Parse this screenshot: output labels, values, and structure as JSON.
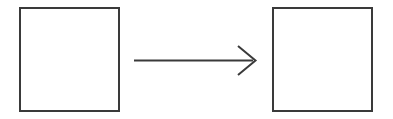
{
  "canvas": {
    "width": 393,
    "height": 119,
    "background_color": "#ffffff"
  },
  "diagram": {
    "type": "transformation-diagram",
    "stroke_color": "#3a3a3a",
    "fill_color": "#ffffff",
    "stroke_width": 2,
    "shapes": [
      {
        "name": "source-square",
        "kind": "rect",
        "label": "",
        "x": 20,
        "y": 8,
        "width": 99,
        "height": 103,
        "stroke": "#3a3a3a",
        "fill": "#ffffff",
        "stroke_width": 2
      },
      {
        "name": "target-square",
        "kind": "rect",
        "label": "",
        "x": 273,
        "y": 8,
        "width": 99,
        "height": 103,
        "stroke": "#3a3a3a",
        "fill": "#ffffff",
        "stroke_width": 2
      }
    ],
    "connector": {
      "name": "transformation-arrow",
      "kind": "arrow",
      "label": "",
      "direction": "right",
      "head_style": "open-chevron",
      "shaft": {
        "x1": 134,
        "y1": 60.5,
        "x2": 253,
        "y2": 60.5
      },
      "head": {
        "points": "238,46 255.5,60.5 238,75"
      },
      "stroke": "#3a3a3a",
      "stroke_width": 2
    }
  }
}
